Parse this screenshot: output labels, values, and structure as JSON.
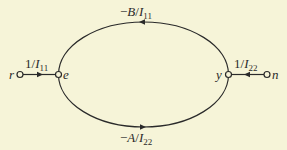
{
  "diagram": {
    "type": "signal-flow-graph",
    "nodes": [
      {
        "id": "r",
        "label": "r"
      },
      {
        "id": "e",
        "label": "e"
      },
      {
        "id": "y",
        "label": "y"
      },
      {
        "id": "n",
        "label": "n"
      }
    ],
    "edges": [
      {
        "from": "r",
        "to": "e",
        "gain_num": "1/",
        "gain_var": "I",
        "gain_sub": "11",
        "direction": "right"
      },
      {
        "from": "n",
        "to": "y",
        "gain_num": "1/",
        "gain_var": "I",
        "gain_sub": "22",
        "direction": "left"
      },
      {
        "from": "y",
        "to": "e",
        "path": "upper-arc",
        "gain_prefix": "−",
        "gain_coef": "B",
        "gain_var": "I",
        "gain_sub": "11",
        "direction": "left"
      },
      {
        "from": "e",
        "to": "y",
        "path": "lower-arc",
        "gain_prefix": "−",
        "gain_coef": "A",
        "gain_var": "I",
        "gain_sub": "22",
        "direction": "right"
      }
    ]
  },
  "colors": {
    "background": "#f6f4d8",
    "ink": "#2a2a2a"
  }
}
